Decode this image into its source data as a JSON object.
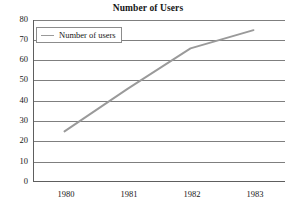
{
  "chart_data": {
    "type": "line",
    "title": "Number of Users",
    "xlabel": "",
    "ylabel": "",
    "categories": [
      "1980",
      "1981",
      "1982",
      "1983"
    ],
    "x": [
      1980,
      1981,
      1982,
      1983
    ],
    "series": [
      {
        "name": "Number of users",
        "values": [
          25,
          46,
          66,
          75
        ],
        "color": "#9a9a9a"
      }
    ],
    "ylim": [
      0,
      80
    ],
    "yticks": [
      0,
      10,
      20,
      30,
      40,
      50,
      60,
      70,
      80
    ],
    "ytick_labels": [
      "0",
      "10",
      "20",
      "30",
      "40",
      "50",
      "60",
      "70",
      "80"
    ],
    "xtick_labels": [
      "1980",
      "1981",
      "1982",
      "1983"
    ],
    "grid": "horizontal",
    "legend": {
      "position": "top-left",
      "entries": [
        "Number of users"
      ]
    },
    "annotations": []
  },
  "chart": {
    "title": "Number of Users",
    "legend_label": "Number of users",
    "y_labels": [
      "80",
      "70",
      "60",
      "50",
      "40",
      "30",
      "20",
      "10",
      "0"
    ],
    "x_labels": [
      "1980",
      "1981",
      "1982",
      "1983"
    ],
    "line_color": "#9a9a9a",
    "grid_color": "#808080",
    "axis_color": "#606060",
    "background": "#ffffff"
  }
}
